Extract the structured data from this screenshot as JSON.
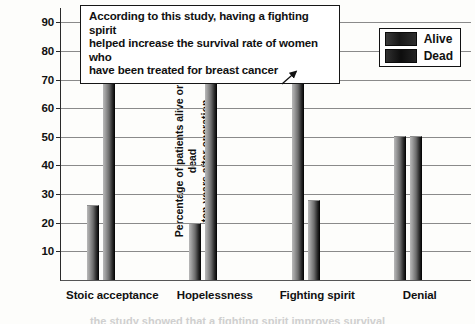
{
  "chart_data": {
    "type": "bar",
    "title": "",
    "subtitle": "",
    "xlabel": "",
    "ylabel": "Percentage of patients alive or dead\nten years after operation",
    "ylim": [
      0,
      95
    ],
    "yticks": [
      10,
      20,
      30,
      40,
      50,
      60,
      70,
      80,
      90
    ],
    "grid": true,
    "legend_position": "top-right",
    "categories": [
      "Stoic acceptance",
      "Hopelessness",
      "Fighting spirit",
      "Denial"
    ],
    "series": [
      {
        "name": "Alive",
        "values": [
          26,
          19.5,
          71.5,
          50
        ]
      },
      {
        "name": "Dead",
        "values": [
          76.5,
          81,
          27.5,
          50
        ]
      }
    ],
    "series_order_per_category": [
      [
        "Alive",
        "Dead"
      ],
      [
        "Alive",
        "Dead"
      ],
      [
        "Alive",
        "Dead"
      ],
      [
        "Alive",
        "Dead"
      ]
    ],
    "annotations": [
      {
        "text": "According to this study, having a fighting spirit\nhelped increase the survival rate of women who\nhave been treated for breast cancer",
        "points_to": {
          "category": "Fighting spirit",
          "series": "Alive",
          "value": 71.5
        }
      }
    ]
  },
  "legend": {
    "items": [
      {
        "label": "Alive",
        "swatch": "alive-swatch"
      },
      {
        "label": "Dead",
        "swatch": "dead-swatch"
      }
    ]
  },
  "colors": {
    "bar_light": "#b9b9b9",
    "bar_dark": "#101010",
    "gridline": "#8a8a8a",
    "axis": "#2a2a2a",
    "text": "#111111",
    "background": "#fdfdfb"
  },
  "bottom_caption": "the study showed that a fighting spirit improves survival"
}
